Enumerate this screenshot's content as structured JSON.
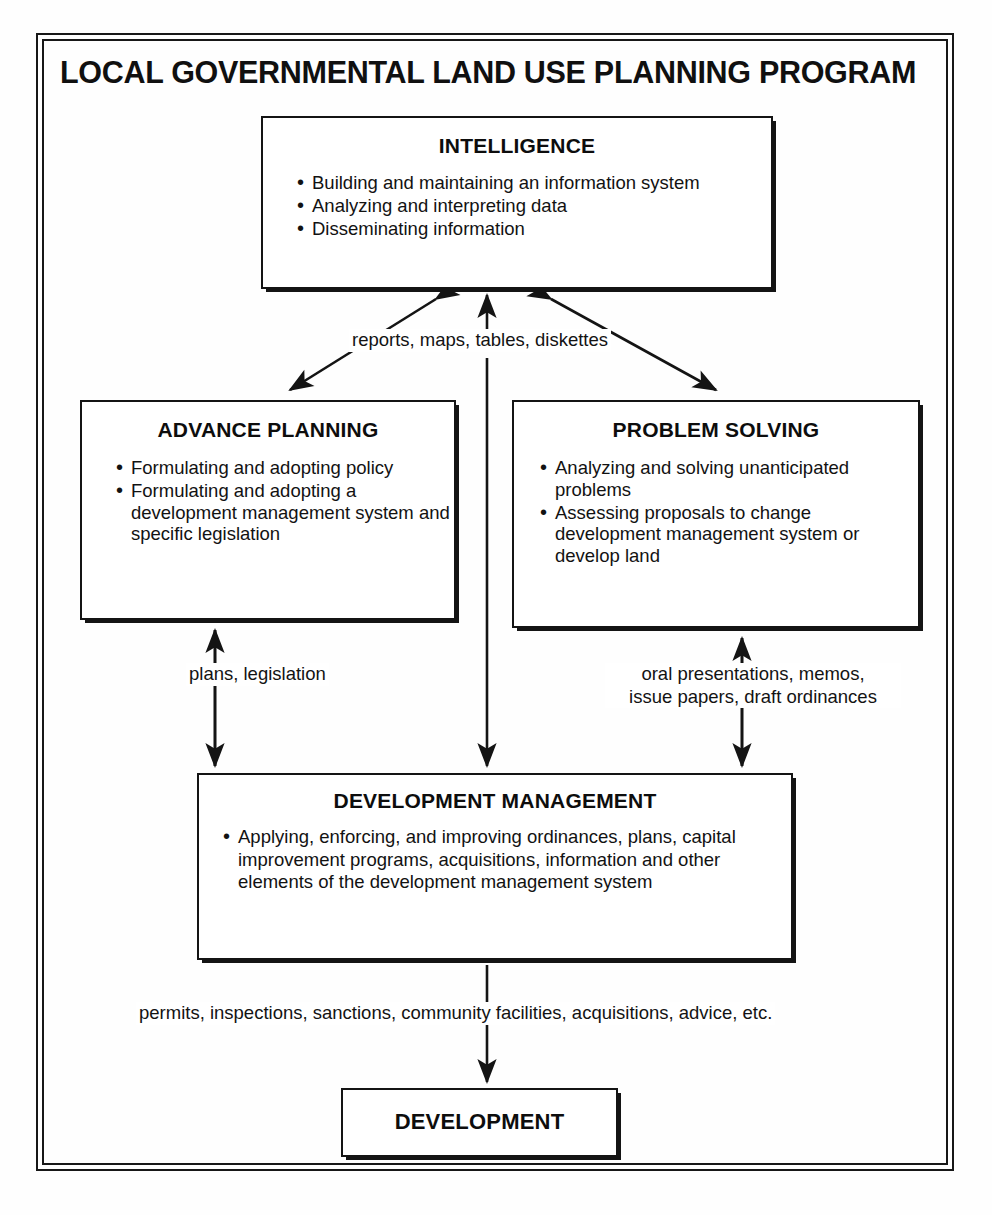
{
  "title": "LOCAL GOVERNMENTAL LAND USE PLANNING PROGRAM",
  "boxes": {
    "intelligence": {
      "title": "INTELLIGENCE",
      "items": [
        "Building and maintaining an information system",
        "Analyzing and interpreting data",
        "Disseminating information"
      ]
    },
    "advance_planning": {
      "title": "ADVANCE PLANNING",
      "items": [
        "Formulating and adopting policy",
        "Formulating and adopting a development management system and  specific legislation"
      ]
    },
    "problem_solving": {
      "title": "PROBLEM SOLVING",
      "items": [
        "Analyzing and solving unanticipated problems",
        "Assessing proposals to change development management system or  develop land"
      ]
    },
    "development_management": {
      "title": "DEVELOPMENT MANAGEMENT",
      "items": [
        "Applying, enforcing, and improving ordinances, plans, capital improvement programs, acquisitions, information and other  elements of the development management system"
      ]
    },
    "development": {
      "title": "DEVELOPMENT"
    }
  },
  "connector_labels": {
    "intelligence_flow": "reports, maps, tables, diskettes",
    "advance_planning_flow": "plans, legislation",
    "problem_solving_flow_line1": "oral presentations, memos,",
    "problem_solving_flow_line2": "issue papers, draft ordinances",
    "development_flow": "permits, inspections, sanctions, community facilities, acquisitions,  advice, etc."
  },
  "colors": {
    "ink": "#141414",
    "paper": "#ffffff"
  }
}
